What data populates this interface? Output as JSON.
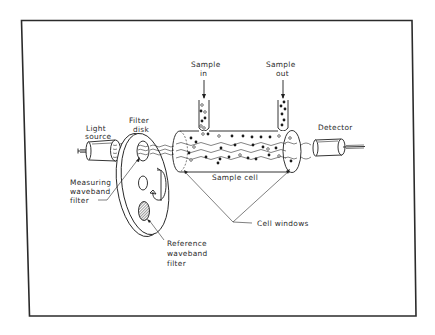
{
  "diagram": {
    "type": "schematic",
    "labels": {
      "light_source_line1": "Light",
      "light_source_line2": "source",
      "filter_disk_line1": "Filter",
      "filter_disk_line2": "disk",
      "sample_in_line1": "Sample",
      "sample_in_line2": "in",
      "sample_out_line1": "Sample",
      "sample_out_line2": "out",
      "detector": "Detector",
      "measuring_filter_line1": "Measuring",
      "measuring_filter_line2": "waveband",
      "measuring_filter_line3": "filter",
      "sample_cell": "Sample cell",
      "cell_windows": "Cell windows",
      "reference_filter_line1": "Reference",
      "reference_filter_line2": "waveband",
      "reference_filter_line3": "filter"
    },
    "components": [
      {
        "id": "light-source",
        "label": "Light source"
      },
      {
        "id": "filter-disk",
        "label": "Filter disk"
      },
      {
        "id": "measuring-waveband-filter",
        "label": "Measuring waveband filter"
      },
      {
        "id": "reference-waveband-filter",
        "label": "Reference waveband filter"
      },
      {
        "id": "sample-cell",
        "label": "Sample cell"
      },
      {
        "id": "sample-inlet",
        "label": "Sample in"
      },
      {
        "id": "sample-outlet",
        "label": "Sample out"
      },
      {
        "id": "cell-windows",
        "label": "Cell windows"
      },
      {
        "id": "detector",
        "label": "Detector"
      }
    ],
    "colors": {
      "ink": "#1e1e1e",
      "background": "#ffffff",
      "frame": "#2b2b2b"
    }
  }
}
